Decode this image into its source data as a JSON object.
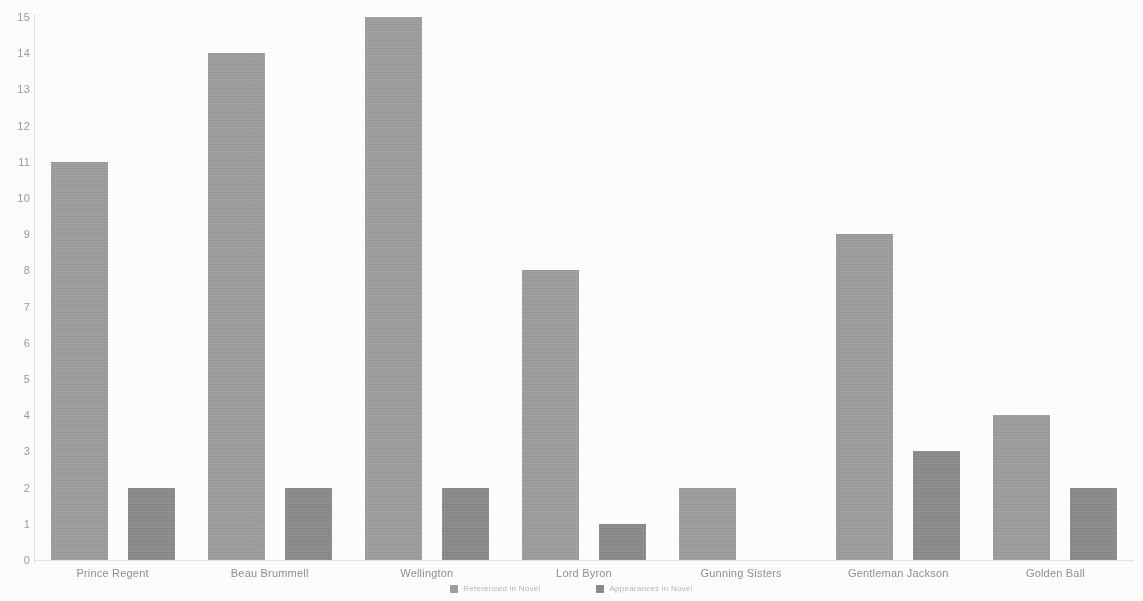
{
  "chart_data": {
    "type": "bar",
    "title": "",
    "subtitle": "",
    "xlabel": "",
    "ylabel": "",
    "ylim": [
      0,
      15
    ],
    "yticks": [
      0,
      1,
      2,
      3,
      4,
      5,
      6,
      7,
      8,
      9,
      10,
      11,
      12,
      13,
      14,
      15
    ],
    "grid": false,
    "legend_position": "bottom",
    "orientation": "vertical",
    "grouping": "grouped",
    "categories": [
      "Prince Regent",
      "Beau Brummell",
      "Wellington",
      "Lord Byron",
      "Gunning Sisters",
      "Gentleman Jackson",
      "Golden Ball"
    ],
    "series": [
      {
        "name": "Referenced in Novel",
        "color": "#9e9e9e",
        "values": [
          11,
          14,
          15,
          8,
          2,
          9,
          4
        ]
      },
      {
        "name": "Appearances in Novel",
        "color": "#8b8b8b",
        "values": [
          2,
          2,
          2,
          1,
          0,
          3,
          2
        ]
      }
    ]
  },
  "axis": {
    "y_tick_labels": [
      "0",
      "1",
      "2",
      "3",
      "4",
      "5",
      "6",
      "7",
      "8",
      "9",
      "10",
      "11",
      "12",
      "13",
      "14",
      "15"
    ]
  },
  "colors": {
    "series_light": "#9e9e9e",
    "series_dark": "#8b8b8b",
    "axis": "#e2e2e2",
    "tick_text": "#9b9b9b",
    "category_text": "#8f8f8f",
    "legend_text": "#b4b4b4",
    "background": "#fdfdfd"
  }
}
